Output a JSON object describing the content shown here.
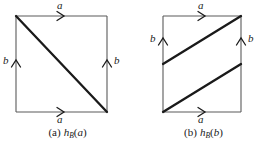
{
  "figure": {
    "background_color": "#ffffff",
    "ink_color": "#1a1a1a",
    "thin_stroke_color": "#5a5a5a",
    "panels": [
      {
        "id": "a",
        "caption_tag": "(a)",
        "caption_fn": "h",
        "caption_sub": "B",
        "caption_open": "(",
        "caption_arg": "a",
        "caption_close": ")",
        "caption_full": "(a)  h_B(a)",
        "square": {
          "left": 16,
          "top": 16,
          "right": 107,
          "bottom": 112
        },
        "edges": [
          {
            "name": "top",
            "label": "a",
            "direction": "right"
          },
          {
            "name": "bottom",
            "label": "a",
            "direction": "right"
          },
          {
            "name": "left",
            "label": "b",
            "direction": "up"
          },
          {
            "name": "right",
            "label": "b",
            "direction": "up"
          }
        ],
        "heavy_lines": [
          {
            "name": "main-diagonal",
            "from": "top-left",
            "to": "bottom-right"
          }
        ],
        "labels": {
          "top": "a",
          "bottom": "a",
          "left": "b",
          "right": "b"
        }
      },
      {
        "id": "b",
        "caption_tag": "(b)",
        "caption_fn": "h",
        "caption_sub": "B",
        "caption_open": "(",
        "caption_arg": "b",
        "caption_close": ")",
        "caption_full": "(b)  h_B(b)",
        "square": {
          "left": 27,
          "top": 16,
          "right": 105,
          "bottom": 112
        },
        "edges": [
          {
            "name": "top",
            "label": "a",
            "direction": "right"
          },
          {
            "name": "bottom",
            "label": "a",
            "direction": "right"
          },
          {
            "name": "left",
            "label": "b",
            "direction": "up"
          },
          {
            "name": "right",
            "label": "b",
            "direction": "up"
          }
        ],
        "heavy_lines": [
          {
            "name": "upper-diagonal",
            "from": "left-edge-mid",
            "to": "top-right"
          },
          {
            "name": "lower-diagonal",
            "from": "bottom-left",
            "to": "right-edge-mid"
          }
        ],
        "labels": {
          "top": "a",
          "bottom": "a",
          "left": "b",
          "right": "b"
        }
      }
    ]
  }
}
